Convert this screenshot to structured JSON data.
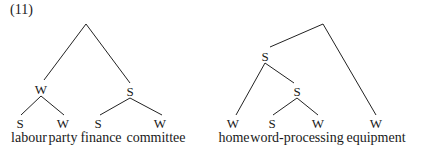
{
  "example_number": "(11)",
  "trees": [
    {
      "name": "labour-party-finance-committee",
      "root": {
        "label": "",
        "children": [
          {
            "label": "W",
            "children": [
              {
                "label": "S",
                "word": "labour"
              },
              {
                "label": "W",
                "word": "party"
              }
            ]
          },
          {
            "label": "S",
            "children": [
              {
                "label": "S",
                "word": "finance"
              },
              {
                "label": "W",
                "word": "committee"
              }
            ]
          }
        ]
      }
    },
    {
      "name": "home-word-processing-equipment",
      "root": {
        "label": "",
        "children": [
          {
            "label": "S",
            "children": [
              {
                "label": "W",
                "word": "home"
              },
              {
                "label": "S",
                "children": [
                  {
                    "label": "S",
                    "word": "word-processing"
                  },
                  {
                    "label": "W",
                    "word": "equipment_placeholder_skip"
                  }
                ]
              }
            ]
          },
          {
            "label": "W",
            "word": "equipment"
          }
        ]
      }
    }
  ],
  "labels": {
    "t1": {
      "w1": "W",
      "s1": "S",
      "l1": "S",
      "l2": "W",
      "l3": "S",
      "l4": "W",
      "words": [
        "labour",
        "party",
        "finance",
        "committee"
      ]
    },
    "t2": {
      "s1": "S",
      "s2": "S",
      "l1": "W",
      "l2": "S",
      "l3": "W",
      "l4": "W",
      "words": [
        "home",
        "word-processing",
        "equipment"
      ]
    }
  }
}
